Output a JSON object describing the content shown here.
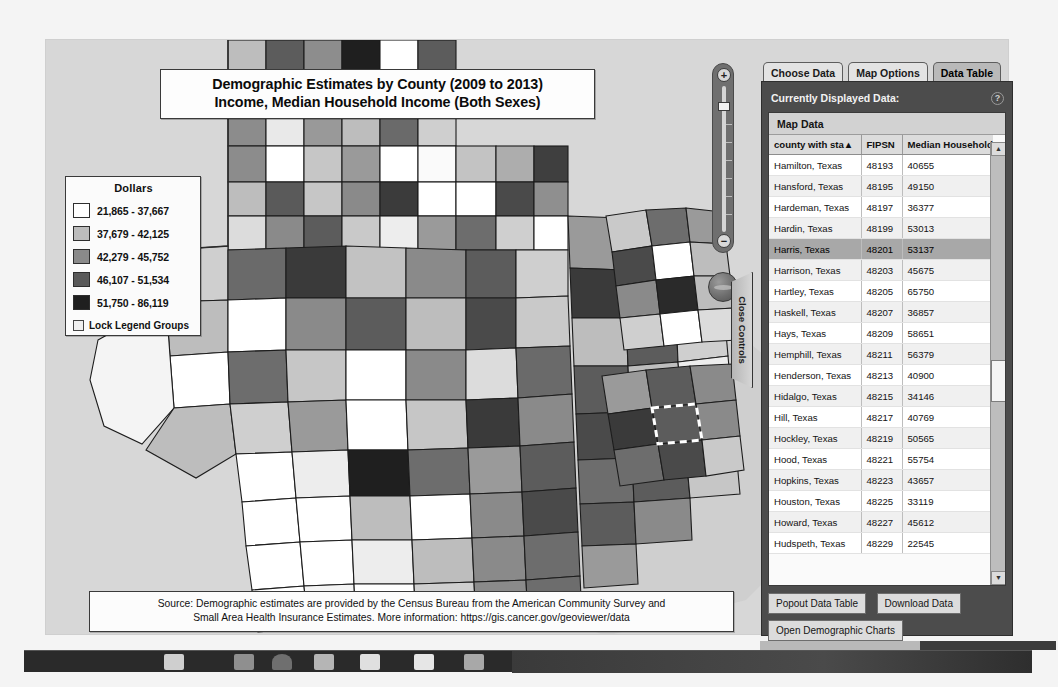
{
  "map": {
    "title_line1": "Demographic Estimates by County (2009 to 2013)",
    "title_line2": "Income, Median Household Income (Both Sexes)",
    "source_line1": "Source: Demographic estimates are provided by the Census Bureau from the American Community Survey and",
    "source_line2": "Small Area Health Insurance Estimates.  More information: https://gis.cancer.gov/geoviewer/data",
    "close_controls_label": "Close Controls",
    "zoom_plus": "+",
    "zoom_minus": "−"
  },
  "legend": {
    "title": "Dollars",
    "lock_label": "Lock Legend Groups",
    "classes": [
      {
        "label": "21,865 - 37,667",
        "color": "#ffffff"
      },
      {
        "label": "37,679 - 42,125",
        "color": "#bcbcbc"
      },
      {
        "label": "42,279 - 45,752",
        "color": "#8a8a8a"
      },
      {
        "label": "46,107 - 51,534",
        "color": "#5a5a5a"
      },
      {
        "label": "51,750 - 86,119",
        "color": "#1f1f1f"
      }
    ]
  },
  "panel": {
    "tabs": [
      {
        "label": "Choose Data",
        "active": false
      },
      {
        "label": "Map Options",
        "active": false
      },
      {
        "label": "Data Table",
        "active": true
      }
    ],
    "header_title": "Currently Displayed Data:",
    "help_icon": "?",
    "map_data_label": "Map Data",
    "columns": [
      "county with sta▲",
      "FIPSN",
      "Median Household In"
    ],
    "selected_row": "Harris, Texas",
    "rows": [
      {
        "county": "Hamilton, Texas",
        "fipsn": "48193",
        "value": "40655"
      },
      {
        "county": "Hansford, Texas",
        "fipsn": "48195",
        "value": "49150"
      },
      {
        "county": "Hardeman, Texas",
        "fipsn": "48197",
        "value": "36377"
      },
      {
        "county": "Hardin, Texas",
        "fipsn": "48199",
        "value": "53013"
      },
      {
        "county": "Harris, Texas",
        "fipsn": "48201",
        "value": "53137"
      },
      {
        "county": "Harrison, Texas",
        "fipsn": "48203",
        "value": "45675"
      },
      {
        "county": "Hartley, Texas",
        "fipsn": "48205",
        "value": "65750"
      },
      {
        "county": "Haskell, Texas",
        "fipsn": "48207",
        "value": "36857"
      },
      {
        "county": "Hays, Texas",
        "fipsn": "48209",
        "value": "58651"
      },
      {
        "county": "Hemphill, Texas",
        "fipsn": "48211",
        "value": "56379"
      },
      {
        "county": "Henderson, Texas",
        "fipsn": "48213",
        "value": "40900"
      },
      {
        "county": "Hidalgo, Texas",
        "fipsn": "48215",
        "value": "34146"
      },
      {
        "county": "Hill, Texas",
        "fipsn": "48217",
        "value": "40769"
      },
      {
        "county": "Hockley, Texas",
        "fipsn": "48219",
        "value": "50565"
      },
      {
        "county": "Hood, Texas",
        "fipsn": "48221",
        "value": "55754"
      },
      {
        "county": "Hopkins, Texas",
        "fipsn": "48223",
        "value": "43657"
      },
      {
        "county": "Houston, Texas",
        "fipsn": "48225",
        "value": "33119"
      },
      {
        "county": "Howard, Texas",
        "fipsn": "48227",
        "value": "45612"
      },
      {
        "county": "Hudspeth, Texas",
        "fipsn": "48229",
        "value": "22545"
      }
    ],
    "scroll_up": "▲",
    "scroll_down": "▼",
    "buttons": [
      "Popout Data Table",
      "Download Data",
      "Open Demographic Charts"
    ]
  }
}
